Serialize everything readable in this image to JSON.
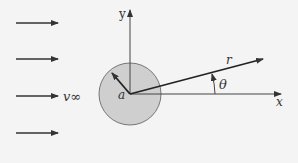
{
  "diagram": {
    "colors": {
      "background": "#f4f4f4",
      "line": "#333333",
      "cylinder_fill": "#cfcfcf",
      "cylinder_stroke": "#777777"
    },
    "labels": {
      "y_axis": "y",
      "x_axis": "x",
      "radius_vector": "r",
      "angle": "θ",
      "cylinder_radius": "a",
      "freestream_velocity": "v∞"
    },
    "freestream_arrows": [
      {
        "y": 23
      },
      {
        "y": 59
      },
      {
        "y": 96
      },
      {
        "y": 133
      }
    ],
    "cylinder": {
      "cx": 130,
      "cy": 94,
      "r": 31
    }
  }
}
